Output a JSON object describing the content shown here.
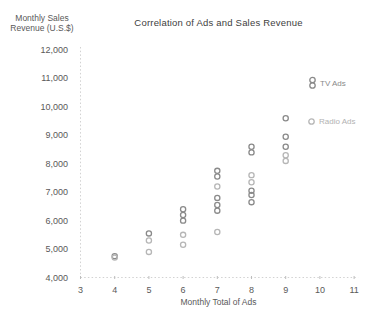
{
  "chart_data": {
    "type": "scatter",
    "title": "Correlation of Ads and Sales Revenue",
    "xlabel": "Monthly Total of Ads",
    "ylabel_lines": [
      "Monthly Sales",
      "Revenue (U.S.$)"
    ],
    "xlim": [
      3,
      11
    ],
    "ylim": [
      4000,
      12000
    ],
    "grid": false,
    "legend_position": "inside-right",
    "x_ticks": [
      3,
      4,
      5,
      6,
      7,
      8,
      9,
      10,
      11
    ],
    "y_ticks": [
      {
        "value": 4000,
        "label": "4,000"
      },
      {
        "value": 5000,
        "label": "5,000"
      },
      {
        "value": 6000,
        "label": "6,000"
      },
      {
        "value": 7000,
        "label": "7,000"
      },
      {
        "value": 8000,
        "label": "8,000"
      },
      {
        "value": 9000,
        "label": "9,000"
      },
      {
        "value": 10000,
        "label": "10,000"
      },
      {
        "value": 11000,
        "label": "11,000"
      },
      {
        "value": 12000,
        "label": "12,000"
      }
    ],
    "series": [
      {
        "name": "TV Ads",
        "color": "#8a8a8a",
        "marker": "circle-outline",
        "legend_marker_circles": 2,
        "points": [
          [
            4,
            4750
          ],
          [
            5,
            5550
          ],
          [
            6,
            6400
          ],
          [
            6,
            6200
          ],
          [
            6,
            6000
          ],
          [
            7,
            7750
          ],
          [
            7,
            7550
          ],
          [
            7,
            6800
          ],
          [
            7,
            6550
          ],
          [
            7,
            6350
          ],
          [
            8,
            8600
          ],
          [
            8,
            8400
          ],
          [
            8,
            7050
          ],
          [
            8,
            6900
          ],
          [
            8,
            6650
          ],
          [
            9,
            9600
          ],
          [
            9,
            8950
          ],
          [
            9,
            8600
          ]
        ]
      },
      {
        "name": "Radio Ads",
        "color": "#b6b6b6",
        "marker": "circle-outline",
        "legend_marker_circles": 1,
        "points": [
          [
            4,
            4700
          ],
          [
            5,
            5300
          ],
          [
            5,
            4900
          ],
          [
            6,
            5500
          ],
          [
            6,
            5150
          ],
          [
            7,
            7200
          ],
          [
            7,
            5600
          ],
          [
            8,
            7600
          ],
          [
            8,
            7350
          ],
          [
            9,
            8300
          ],
          [
            9,
            8100
          ]
        ]
      }
    ]
  },
  "colors": {
    "background": "#ffffff",
    "title_text": "#404040",
    "axis_text": "#595959",
    "axis_line": "#d2d2d2",
    "tick_mark": "#bdbdbd"
  }
}
